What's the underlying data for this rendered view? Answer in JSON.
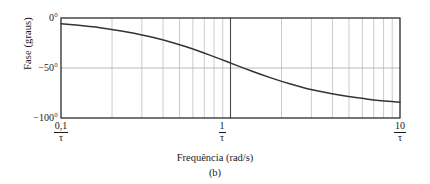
{
  "figure": {
    "caption": "(b)"
  },
  "chart_data": {
    "type": "line",
    "title": "",
    "subtitle": "",
    "xlabel": "Frequência (rad/s)",
    "ylabel": "Fase (graus)",
    "xscale": "log",
    "yscale": "linear",
    "grid": true,
    "grid_style": "log-minor-vertical-and-major-horizontal",
    "legend": null,
    "xlim": [
      0.1,
      10
    ],
    "ylim": [
      -100,
      0
    ],
    "x_unit": "1/tau",
    "y_unit": "degrees",
    "xticks": [
      {
        "value": 0.1,
        "numerator": "0,1",
        "denominator": "τ"
      },
      {
        "value": 1,
        "numerator": "1",
        "denominator": "τ"
      },
      {
        "value": 10,
        "numerator": "10",
        "denominator": "τ"
      }
    ],
    "yticks": [
      {
        "value": 0,
        "label": "0°"
      },
      {
        "value": -50,
        "label": "−50°"
      },
      {
        "value": -100,
        "label": "−100°"
      }
    ],
    "minor_gridlines_x": [
      0.2,
      0.3,
      0.4,
      0.5,
      0.6,
      0.7,
      0.8,
      0.9,
      2,
      3,
      4,
      5,
      6,
      7,
      8,
      9
    ],
    "emphasized_gridline_x": 1,
    "series": [
      {
        "name": "Fase",
        "color": "#333333",
        "equation": "phase = -atan(omega*tau)",
        "x": [
          0.1,
          0.15,
          0.2,
          0.3,
          0.4,
          0.5,
          0.6,
          0.7,
          0.8,
          0.9,
          1.0,
          1.2,
          1.5,
          2.0,
          2.5,
          3.0,
          4.0,
          5.0,
          6.0,
          7.0,
          8.0,
          10.0
        ],
        "y": [
          -5.7,
          -8.5,
          -11.3,
          -16.7,
          -21.8,
          -26.6,
          -31.0,
          -35.0,
          -38.7,
          -42.0,
          -45.0,
          -50.2,
          -56.3,
          -63.4,
          -68.2,
          -71.6,
          -76.0,
          -78.7,
          -80.5,
          -81.9,
          -82.9,
          -84.3
        ]
      }
    ]
  },
  "colors": {
    "axis": "#1a1a1a",
    "grid_minor": "#bfbfbf",
    "grid_major": "#a8a8a8",
    "grid_emphasis": "#4a4a4a",
    "curve": "#333333",
    "background": "#ffffff"
  }
}
